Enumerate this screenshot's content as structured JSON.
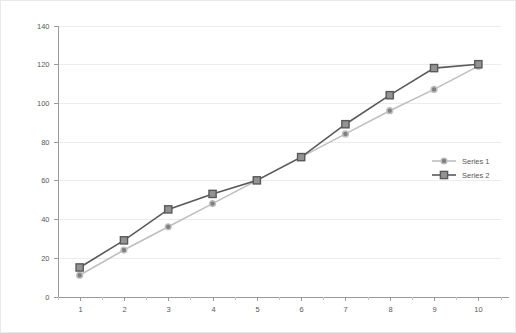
{
  "chart_data": {
    "type": "line",
    "title": "",
    "subtitle": "",
    "xlabel": "",
    "ylabel": "",
    "x": [
      1,
      2,
      3,
      4,
      5,
      6,
      7,
      8,
      9,
      10
    ],
    "categories": [
      "1",
      "2",
      "3",
      "4",
      "5",
      "6",
      "7",
      "8",
      "9",
      "10"
    ],
    "series": [
      {
        "name": "Series 1",
        "values": [
          11,
          24,
          36,
          48,
          60,
          72,
          84,
          96,
          107,
          119
        ],
        "color": "#bfbfbf",
        "marker": "circle",
        "marker_fill": "#808080",
        "marker_stroke": "#bfbfbf"
      },
      {
        "name": "Series 2",
        "values": [
          15,
          29,
          45,
          53,
          60,
          72,
          89,
          104,
          118,
          120
        ],
        "color": "#595959",
        "marker": "square",
        "marker_fill": "#939393",
        "marker_stroke": "#595959"
      }
    ],
    "xlim": [
      0.5,
      10.5
    ],
    "ylim": [
      0,
      140
    ],
    "ytick_labels": [
      "0",
      "20",
      "40",
      "60",
      "80",
      "100",
      "120",
      "140"
    ],
    "ytick_values": [
      0,
      20,
      40,
      60,
      80,
      100,
      120,
      140
    ],
    "xtick_labels": [
      "1",
      "2",
      "3",
      "4",
      "5",
      "6",
      "7",
      "8",
      "9",
      "10"
    ],
    "grid": "horizontal",
    "grid_color": "#ececec",
    "legend_position": "right-middle",
    "legend_entries": [
      "Series 1",
      "Series 2"
    ],
    "background_color": "#ffffff",
    "axis_color": "#9a9a9a",
    "text_color": "#58585a"
  },
  "axis": {
    "y_labels": [
      "140",
      "120",
      "100",
      "80",
      "60",
      "40",
      "20",
      "0"
    ],
    "x_labels": [
      "1",
      "2",
      "3",
      "4",
      "5",
      "6",
      "7",
      "8",
      "9",
      "10"
    ]
  },
  "legend": {
    "items": [
      {
        "label": "Series 1"
      },
      {
        "label": "Series 2"
      }
    ]
  }
}
